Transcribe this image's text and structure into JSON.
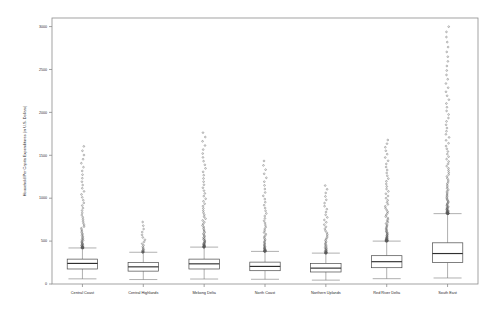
{
  "chart_data": {
    "type": "boxplot",
    "title": "",
    "xlabel": "",
    "ylabel": "Household Per Capita Expenditures (in U.S. Dollars)",
    "ylim": [
      0,
      3100
    ],
    "yticks": [
      0,
      500,
      1000,
      1500,
      2000,
      2500,
      3000
    ],
    "ytick_labels": [
      "0",
      "500",
      "1000",
      "1500",
      "2000",
      "2500",
      "3000"
    ],
    "grid": false,
    "legend": "none",
    "categories": [
      "Central Coast",
      "Central Highlands",
      "Mekong Delta",
      "North Coast",
      "Northern Uplands",
      "Red River Delta",
      "South East"
    ],
    "series": [
      {
        "name": "Central Coast",
        "whisker_low": 60,
        "q1": 175,
        "median": 240,
        "q3": 290,
        "whisker_high": 420,
        "outlier_max": 1630,
        "outlier_count": 62
      },
      {
        "name": "Central Highlands",
        "whisker_low": 52,
        "q1": 150,
        "median": 200,
        "q3": 250,
        "whisker_high": 370,
        "outlier_max": 745,
        "outlier_count": 22
      },
      {
        "name": "Mekong Delta",
        "whisker_low": 58,
        "q1": 175,
        "median": 235,
        "q3": 290,
        "whisker_high": 430,
        "outlier_max": 1790,
        "outlier_count": 70
      },
      {
        "name": "North Coast",
        "whisker_low": 55,
        "q1": 155,
        "median": 205,
        "q3": 255,
        "whisker_high": 380,
        "outlier_max": 1460,
        "outlier_count": 55
      },
      {
        "name": "Northern Uplands",
        "whisker_low": 45,
        "q1": 140,
        "median": 185,
        "q3": 240,
        "whisker_high": 360,
        "outlier_max": 1170,
        "outlier_count": 48
      },
      {
        "name": "Red River Delta",
        "whisker_low": 62,
        "q1": 190,
        "median": 260,
        "q3": 330,
        "whisker_high": 500,
        "outlier_max": 1700,
        "outlier_count": 74
      },
      {
        "name": "South East",
        "whisker_low": 70,
        "q1": 250,
        "median": 355,
        "q3": 480,
        "whisker_high": 820,
        "outlier_max": 3030,
        "outlier_count": 96
      }
    ]
  },
  "axes": {
    "ylabel": "Household Per Capita Expenditures (in U.S. Dollars)"
  }
}
